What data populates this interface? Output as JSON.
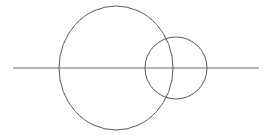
{
  "canvas": {
    "width": 266,
    "height": 138,
    "background_color": "#ffffff",
    "description": "Line drawing of two overlapping circles bisected by a horizontal line"
  },
  "style": {
    "stroke_color": "#5a5a5a",
    "stroke_color_line": "#6b6b6b",
    "stroke_width": 1,
    "fill": "none"
  },
  "shapes": {
    "large_circle": {
      "name": "large-circle",
      "type": "ellipse",
      "cx": 116,
      "cy": 68,
      "rx": 57,
      "ry": 62,
      "left": 59,
      "right": 173,
      "top": 6,
      "bottom": 130
    },
    "small_circle": {
      "name": "small-circle",
      "type": "circle",
      "cx": 176,
      "cy": 68,
      "r": 31,
      "left": 145,
      "right": 207,
      "top": 37,
      "bottom": 99
    },
    "horizontal_line": {
      "name": "horizontal-line",
      "type": "line",
      "x1": 13,
      "y1": 68,
      "x2": 259,
      "y2": 68
    }
  }
}
